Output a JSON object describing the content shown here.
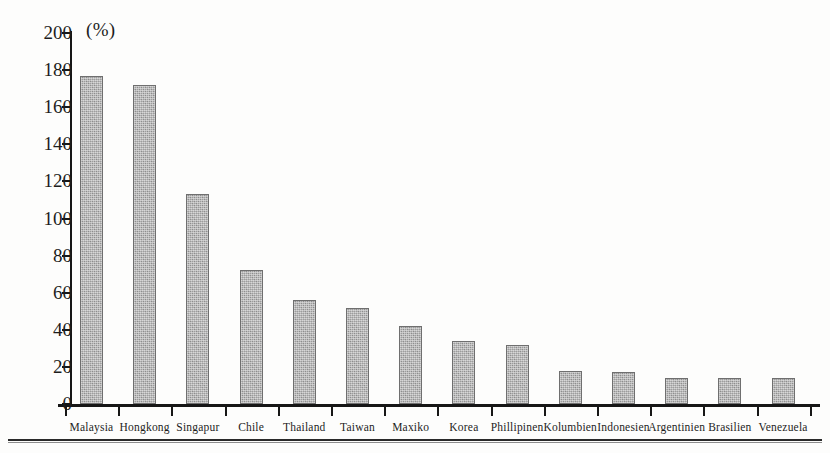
{
  "chart_data": {
    "type": "bar",
    "title": "",
    "subtitle": "",
    "unit_label": "(%)",
    "xlabel": "",
    "ylabel": "",
    "ylim": [
      0,
      200
    ],
    "y_ticks": [
      0,
      20,
      40,
      60,
      80,
      100,
      120,
      140,
      160,
      180,
      200
    ],
    "grid": false,
    "legend": null,
    "categories": [
      "Malaysia",
      "Hongkong",
      "Singapur",
      "Chile",
      "Thailand",
      "Taiwan",
      "Maxiko",
      "Korea",
      "Phillipinen",
      "Kolumbien",
      "Indonesien",
      "Argentinien",
      "Brasilien",
      "Venezuela"
    ],
    "values": [
      177,
      172,
      113,
      72,
      56,
      52,
      42,
      34,
      32,
      18,
      17,
      14,
      14,
      14
    ],
    "bar_color": "#9d9d9d",
    "bar_edge_color": "#6f6f6f",
    "axis_color": "#161616"
  }
}
